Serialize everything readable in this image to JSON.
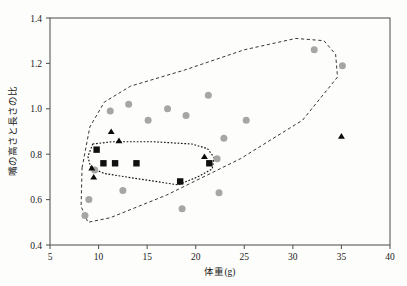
{
  "chart_data": {
    "type": "scatter",
    "title": "",
    "xlabel": "体重(g)",
    "ylabel": "嘴の高さと長さの比",
    "xlim": [
      5,
      40
    ],
    "ylim": [
      0.4,
      1.4
    ],
    "xticks": [
      "5",
      "10",
      "15",
      "20",
      "25",
      "30",
      "35",
      "40"
    ],
    "xtick_values": [
      5,
      10,
      15,
      20,
      25,
      30,
      35,
      40
    ],
    "yticks": [
      "0.4",
      "0.6",
      "0.8",
      "1.0",
      "1.2",
      "1.4"
    ],
    "ytick_values": [
      0.4,
      0.6,
      0.8,
      1.0,
      1.2,
      1.4
    ],
    "grid": false,
    "legend": "none",
    "series": [
      {
        "name": "gray-circles",
        "marker": "circle",
        "color": "#a6a6a6",
        "points": [
          [
            8.6,
            0.53
          ],
          [
            9.0,
            0.6
          ],
          [
            9.6,
            0.73
          ],
          [
            11.2,
            0.99
          ],
          [
            12.5,
            0.64
          ],
          [
            13.1,
            1.02
          ],
          [
            15.1,
            0.95
          ],
          [
            17.1,
            1.0
          ],
          [
            18.6,
            0.56
          ],
          [
            19.0,
            0.97
          ],
          [
            21.3,
            1.06
          ],
          [
            22.2,
            0.78
          ],
          [
            22.4,
            0.63
          ],
          [
            22.9,
            0.87
          ],
          [
            25.2,
            0.95
          ],
          [
            32.2,
            1.26
          ],
          [
            35.1,
            1.19
          ]
        ]
      },
      {
        "name": "black-squares",
        "marker": "square",
        "color": "#101010",
        "points": [
          [
            9.8,
            0.82
          ],
          [
            10.5,
            0.76
          ],
          [
            11.7,
            0.76
          ],
          [
            13.9,
            0.76
          ],
          [
            18.4,
            0.68
          ],
          [
            21.4,
            0.76
          ]
        ]
      },
      {
        "name": "black-triangles",
        "marker": "triangle",
        "color": "#0b0b0b",
        "points": [
          [
            9.3,
            0.74
          ],
          [
            9.5,
            0.7
          ],
          [
            11.3,
            0.9
          ],
          [
            12.1,
            0.86
          ],
          [
            20.9,
            0.79
          ],
          [
            35.0,
            0.88
          ]
        ]
      }
    ],
    "hulls": [
      {
        "name": "outer-hull",
        "style": "dashed",
        "vertices": [
          [
            8.3,
            0.74
          ],
          [
            9.1,
            0.92
          ],
          [
            10.6,
            1.03
          ],
          [
            13.3,
            1.1
          ],
          [
            18.8,
            1.17
          ],
          [
            25.0,
            1.26
          ],
          [
            30.3,
            1.31
          ],
          [
            33.2,
            1.3
          ],
          [
            34.4,
            1.24
          ],
          [
            34.6,
            1.14
          ],
          [
            31.0,
            0.95
          ],
          [
            24.6,
            0.78
          ],
          [
            17.0,
            0.62
          ],
          [
            11.2,
            0.52
          ],
          [
            8.9,
            0.5
          ],
          [
            8.2,
            0.57
          ]
        ]
      },
      {
        "name": "inner-hull",
        "style": "dotted",
        "vertices": [
          [
            9.4,
            0.845
          ],
          [
            11.4,
            0.855
          ],
          [
            15.6,
            0.855
          ],
          [
            19.6,
            0.845
          ],
          [
            21.2,
            0.825
          ],
          [
            21.9,
            0.785
          ],
          [
            21.7,
            0.735
          ],
          [
            20.2,
            0.7
          ],
          [
            18.2,
            0.665
          ],
          [
            14.3,
            0.69
          ],
          [
            10.6,
            0.715
          ],
          [
            9.2,
            0.74
          ],
          [
            8.9,
            0.79
          ]
        ]
      }
    ]
  },
  "axes": {
    "x_title": "体重(g)",
    "y_title": "嘴の高さと長さの比"
  }
}
